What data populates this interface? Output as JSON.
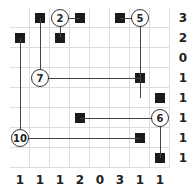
{
  "puzzle": {
    "rows": 8,
    "cols": 8,
    "row_clues": [
      "3",
      "2",
      "0",
      "1",
      "1",
      "1",
      "1",
      "1"
    ],
    "col_clues": [
      "1",
      "1",
      "1",
      "2",
      "0",
      "3",
      "1",
      "1"
    ],
    "circles": [
      {
        "r": 0,
        "c": 2,
        "value": "2"
      },
      {
        "r": 0,
        "c": 6,
        "value": "5"
      },
      {
        "r": 3,
        "c": 1,
        "value": "7"
      },
      {
        "r": 5,
        "c": 7,
        "value": "6"
      },
      {
        "r": 6,
        "c": 0,
        "value": "10"
      }
    ],
    "squares": [
      [
        0,
        1
      ],
      [
        0,
        3
      ],
      [
        0,
        5
      ],
      [
        1,
        0
      ],
      [
        1,
        2
      ],
      [
        3,
        6
      ],
      [
        4,
        7
      ],
      [
        5,
        3
      ],
      [
        6,
        6
      ],
      [
        7,
        7
      ]
    ]
  }
}
